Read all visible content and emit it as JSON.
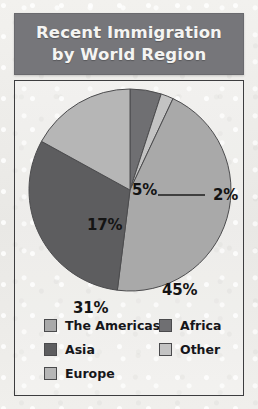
{
  "title": {
    "line1": "Recent Immigration",
    "line2": "by World Region"
  },
  "colors": {
    "header_bg": "#76767a",
    "header_text": "#f4f4f2",
    "panel_border": "#3d3d3f",
    "page_bg": "#eeeeec",
    "americas": "#a9a9a9",
    "asia": "#5d5d5f",
    "europe": "#b6b6b6",
    "africa": "#6f6f72",
    "other": "#c3c3c3"
  },
  "chart_data": {
    "type": "pie",
    "title": "Recent Immigration by World Region",
    "categories": [
      "Africa",
      "Other",
      "The Americas",
      "Asia",
      "Europe"
    ],
    "values": [
      5,
      2,
      45,
      31,
      17
    ],
    "unit": "%",
    "labels": [
      "5%",
      "2%",
      "45%",
      "31%",
      "17%"
    ],
    "legend_position": "bottom",
    "grid": false,
    "slices": [
      {
        "label": "Africa",
        "value": 5,
        "display": "5%",
        "color": "#6f6f72",
        "label_outside": false
      },
      {
        "label": "Other",
        "value": 2,
        "display": "2%",
        "color": "#c3c3c3",
        "label_outside": true,
        "leader_line": true
      },
      {
        "label": "The Americas",
        "value": 45,
        "display": "45%",
        "color": "#a9a9a9",
        "label_outside": false
      },
      {
        "label": "Asia",
        "value": 31,
        "display": "31%",
        "color": "#5d5d5f",
        "label_outside": false
      },
      {
        "label": "Europe",
        "value": 17,
        "display": "17%",
        "color": "#b6b6b6",
        "label_outside": false
      }
    ]
  },
  "legend": {
    "left_column": [
      {
        "label": "The Americas",
        "color": "#a9a9a9"
      },
      {
        "label": "Asia",
        "color": "#5d5d5f"
      },
      {
        "label": "Europe",
        "color": "#b6b6b6"
      }
    ],
    "right_column": [
      {
        "label": "Africa",
        "color": "#6f6f72"
      },
      {
        "label": "Other",
        "color": "#c3c3c3"
      }
    ]
  }
}
